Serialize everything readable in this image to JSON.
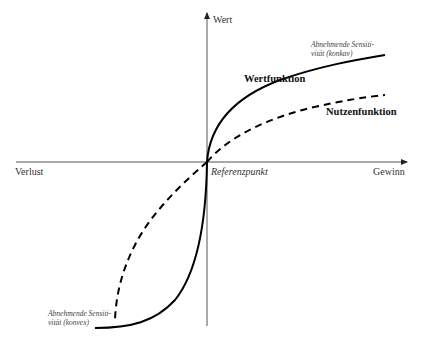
{
  "diagram": {
    "type": "prospect-theory-value-function",
    "axes": {
      "y_label": "Wert",
      "x_left_label": "Verlust",
      "x_right_label": "Gewinn",
      "origin_label": "Referenzpunkt"
    },
    "curves": [
      {
        "name": "Wertfunktion",
        "style": "solid",
        "color": "#000000"
      },
      {
        "name": "Nutzenfunktion",
        "style": "dashed",
        "color": "#000000"
      }
    ],
    "annotations": {
      "upper_right_line1": "Abnehmende Sensiti-",
      "upper_right_line2": "vität (konkav)",
      "lower_left_line1": "Abnehmende Sensiti-",
      "lower_left_line2": "vität (konvex)"
    }
  }
}
